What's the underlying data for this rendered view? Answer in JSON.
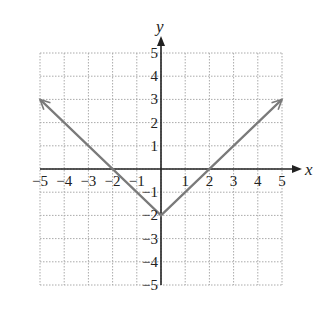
{
  "chart_data": {
    "type": "line",
    "title": "",
    "xlabel": "x",
    "ylabel": "y",
    "xlim": [
      -5,
      5
    ],
    "ylim": [
      -5,
      5
    ],
    "grid": true,
    "x_ticks": [
      "−5",
      "−4",
      "−3",
      "−2",
      "−1",
      "1",
      "2",
      "3",
      "4",
      "5"
    ],
    "y_ticks": [
      "5",
      "4",
      "3",
      "2",
      "1",
      "−1",
      "−2",
      "−3",
      "−4",
      "−5"
    ],
    "series": [
      {
        "name": "y = |x| − 2",
        "x": [
          -5,
          0,
          5
        ],
        "y": [
          3,
          -2,
          3
        ],
        "color": "#7a7a7a",
        "arrows": "both ends"
      }
    ],
    "legend": null
  }
}
